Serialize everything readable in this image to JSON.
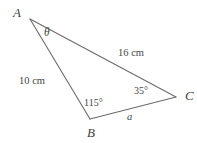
{
  "figure": {
    "type": "triangle-diagram",
    "background_color": "#ffffff",
    "stroke_color": "#6b6b6b",
    "text_color": "#444444",
    "vertices": {
      "A": {
        "label": "A",
        "x": 30,
        "y": 19,
        "label_x": 13,
        "label_y": 6
      },
      "B": {
        "label": "B",
        "x": 90,
        "y": 119,
        "label_x": 87,
        "label_y": 126
      },
      "C": {
        "label": "C",
        "x": 176,
        "y": 97,
        "label_x": 185,
        "label_y": 89
      }
    },
    "sides": [
      {
        "name": "AB",
        "label": "10 cm",
        "label_x": 19,
        "label_y": 76,
        "from": "A",
        "to": "B"
      },
      {
        "name": "AC",
        "label": "16 cm",
        "label_x": 118,
        "label_y": 48,
        "from": "A",
        "to": "C"
      },
      {
        "name": "BC",
        "label": "a",
        "label_x": 127,
        "label_y": 112,
        "from": "B",
        "to": "C"
      }
    ],
    "angles": [
      {
        "name": "angle-A",
        "label": "θ",
        "label_x": 44,
        "label_y": 27,
        "at": "A"
      },
      {
        "name": "angle-B",
        "label": "115°",
        "label_x": 84,
        "label_y": 98,
        "at": "B"
      },
      {
        "name": "angle-C",
        "label": "35°",
        "label_x": 134,
        "label_y": 86,
        "at": "C"
      }
    ]
  }
}
